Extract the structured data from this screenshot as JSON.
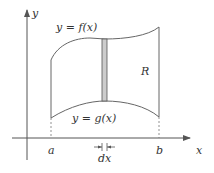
{
  "diagram": {
    "type": "region-between-curves",
    "axes": {
      "x_label": "x",
      "y_label": "y"
    },
    "curves": {
      "top": {
        "label": "y = f(x)"
      },
      "bottom": {
        "label": "y = g(x)"
      }
    },
    "region_label": "R",
    "bounds": {
      "left": "a",
      "right": "b"
    },
    "strip_width_label": "dx",
    "colors": {
      "line": "#555555",
      "strip_fill": "#cccccc",
      "text": "#333333"
    }
  }
}
